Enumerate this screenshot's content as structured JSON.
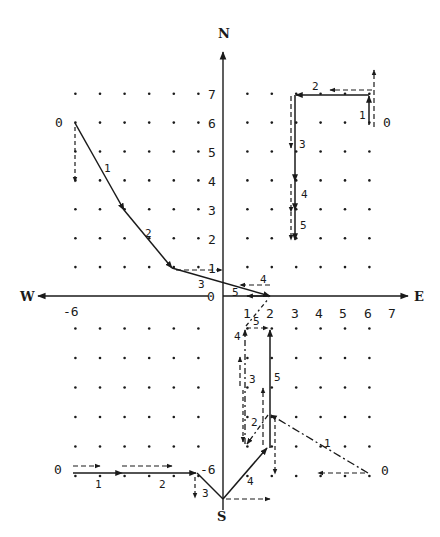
{
  "diagram": {
    "compass": {
      "north": "N",
      "south": "S",
      "east": "E",
      "west": "W"
    },
    "axis_ticks": {
      "y_positive": [
        "1",
        "2",
        "3",
        "4",
        "5",
        "6",
        "7"
      ],
      "x_positive": [
        "1",
        "2",
        "3",
        "4",
        "5",
        "6",
        "7"
      ],
      "west_label": "-6",
      "origin_label": "0",
      "south_label": "-6"
    },
    "grid": {
      "x_range": [
        -6,
        6
      ],
      "y_range": [
        -6,
        7
      ]
    },
    "colors": {
      "ink": "#1a1a1a"
    },
    "paths": [
      {
        "name": "nw-path",
        "start_label": "0",
        "points": [
          [
            -6,
            6
          ],
          [
            -4,
            3
          ],
          [
            -2,
            1
          ],
          [
            2,
            0
          ]
        ],
        "segment_labels": [
          "1",
          "2",
          "3"
        ],
        "extra_labels": [
          "4",
          "5"
        ],
        "style": "solid"
      },
      {
        "name": "ne-path",
        "start_label": "0",
        "points": [
          [
            6,
            6
          ],
          [
            6,
            7
          ],
          [
            3,
            7
          ],
          [
            3,
            5
          ],
          [
            3,
            4
          ],
          [
            3,
            2
          ]
        ],
        "segment_labels": [
          "1",
          "2",
          "3",
          "4",
          "5"
        ],
        "style": "solid"
      },
      {
        "name": "sw-path",
        "start_label": "0",
        "points": [
          [
            -6,
            -6
          ],
          [
            -4,
            -6
          ],
          [
            -1,
            -6
          ],
          [
            0,
            -7
          ]
        ],
        "segment_labels": [
          "1",
          "2",
          "3"
        ],
        "end_label": "-6",
        "style": "solid"
      },
      {
        "name": "s-path",
        "start_label": "S",
        "points": [
          [
            0,
            -7
          ],
          [
            2,
            -4.9
          ],
          [
            2,
            -1
          ]
        ],
        "segment_labels": [
          "4",
          "5"
        ],
        "style": "solid"
      },
      {
        "name": "se-path",
        "start_label": "0",
        "points": [
          [
            6,
            -6
          ],
          [
            2,
            -4
          ],
          [
            1,
            -5
          ],
          [
            1,
            -1
          ],
          [
            2,
            0
          ]
        ],
        "segment_labels": [
          "1",
          "2",
          "3",
          "4",
          "5"
        ],
        "style": "dash-dot"
      }
    ]
  }
}
